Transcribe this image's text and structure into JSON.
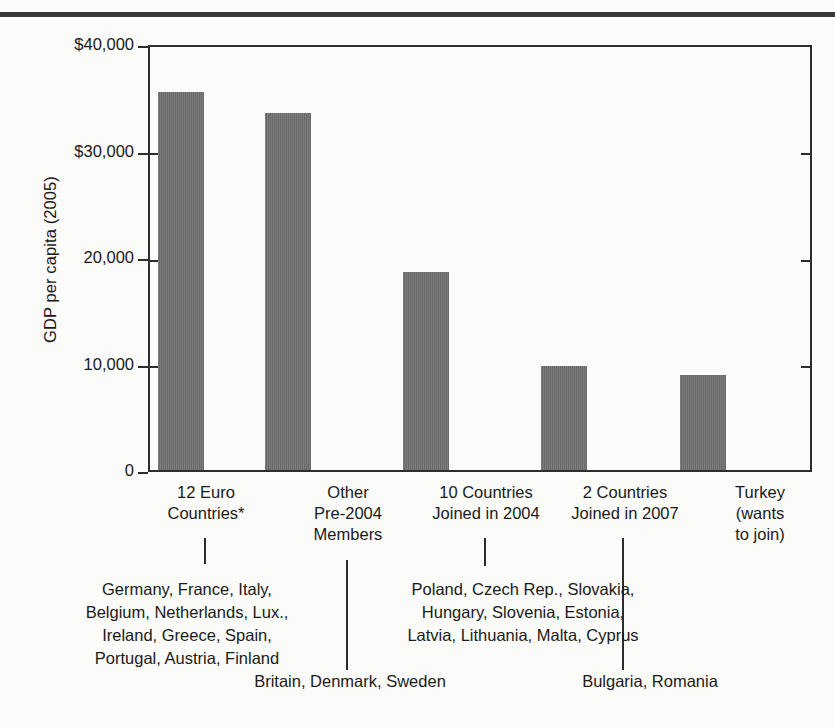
{
  "figure": {
    "top_rule": "horizontal-rule",
    "ylabel": "GDP per capita (2005)",
    "y_ticks": [
      "$40,000",
      "$30,000",
      "20,000",
      "10,000",
      "0"
    ],
    "categories": [
      "12 Euro\nCountries*",
      "Other\nPre-2004\nMembers",
      "10 Countries\nJoined in 2004",
      "2 Countries\nJoined in 2007",
      "Turkey\n(wants\nto join)"
    ],
    "notes": {
      "euro_countries": "Germany, France, Italy,\nBelgium, Netherlands, Lux.,\nIreland, Greece, Spain,\nPortugal, Austria, Finland",
      "joined_2004": "Poland, Czech Rep., Slovakia,\nHungary, Slovenia, Estonia,\nLatvia, Lithuania, Malta, Cyprus",
      "other_pre2004": "Britain, Denmark, Sweden",
      "joined_2007": "Bulgaria, Romania"
    },
    "colors": {
      "bar": "#6f6f6f",
      "axis": "#2d2d2d",
      "rule": "#3a3a3a",
      "background": "#fbfbf9"
    }
  },
  "chart_data": {
    "type": "bar",
    "title": "",
    "xlabel": "",
    "ylabel": "GDP per capita (2005)",
    "categories": [
      "12 Euro Countries*",
      "Other Pre-2004 Members",
      "10 Countries Joined in 2004",
      "2 Countries Joined in 2007",
      "Turkey (wants to join)"
    ],
    "values": [
      35700,
      33800,
      18700,
      9800,
      9000
    ],
    "ylim": [
      0,
      40000
    ],
    "ytick_values": [
      0,
      10000,
      20000,
      30000,
      40000
    ],
    "ytick_labels": [
      "0",
      "10,000",
      "20,000",
      "$30,000",
      "$40,000"
    ],
    "grid": false,
    "legend": "none",
    "bar_color": "#6f6f6f",
    "annotations": [
      "Germany, France, Italy, Belgium, Netherlands, Lux., Ireland, Greece, Spain, Portugal, Austria, Finland",
      "Poland, Czech Rep., Slovakia, Hungary, Slovenia, Estonia, Latvia, Lithuania, Malta, Cyprus",
      "Britain, Denmark, Sweden",
      "Bulgaria, Romania"
    ]
  }
}
